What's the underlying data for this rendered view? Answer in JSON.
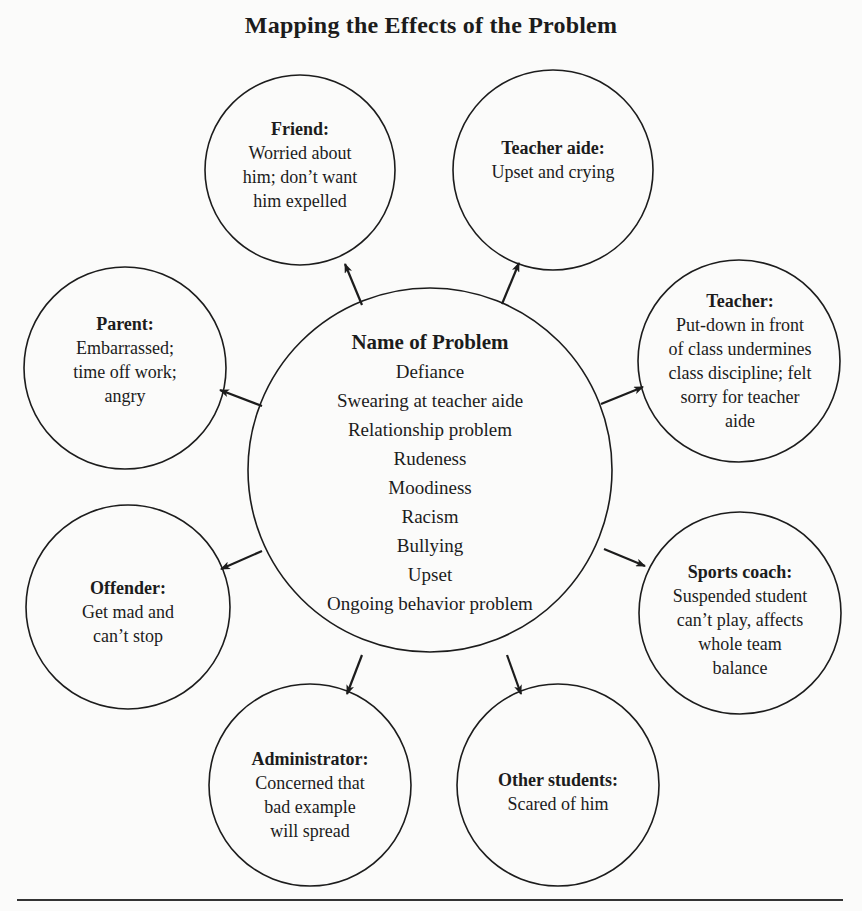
{
  "title": "Mapping the Effects of the Problem",
  "center": {
    "label": "Name of Problem",
    "items": [
      "Defiance",
      "Swearing at teacher aide",
      "Relationship problem",
      "Rudeness",
      "Moodiness",
      "Racism",
      "Bullying",
      "Upset",
      "Ongoing behavior problem"
    ]
  },
  "nodes": [
    {
      "id": "friend",
      "label": "Friend:",
      "lines": [
        "Worried about",
        "him; don’t want",
        "him expelled"
      ]
    },
    {
      "id": "teacher-aide",
      "label": "Teacher aide:",
      "lines": [
        "Upset and crying"
      ]
    },
    {
      "id": "parent",
      "label": "Parent:",
      "lines": [
        "Embarrassed;",
        "time off work;",
        "angry"
      ]
    },
    {
      "id": "teacher",
      "label": "Teacher:",
      "lines": [
        "Put-down in front",
        "of class undermines",
        "class discipline; felt",
        "sorry for teacher",
        "aide"
      ]
    },
    {
      "id": "offender",
      "label": "Offender:",
      "lines": [
        "Get mad and",
        "can’t stop"
      ]
    },
    {
      "id": "sports-coach",
      "label": "Sports coach:",
      "lines": [
        "Suspended student",
        "can’t play, affects",
        "whole team",
        "balance"
      ]
    },
    {
      "id": "administrator",
      "label": "Administrator:",
      "lines": [
        "Concerned that",
        "bad example",
        "will spread"
      ]
    },
    {
      "id": "other-students",
      "label": "Other students:",
      "lines": [
        "Scared of him"
      ]
    }
  ],
  "colors": {
    "background": "#fbfbfa",
    "ink": "#1c1c1c"
  }
}
